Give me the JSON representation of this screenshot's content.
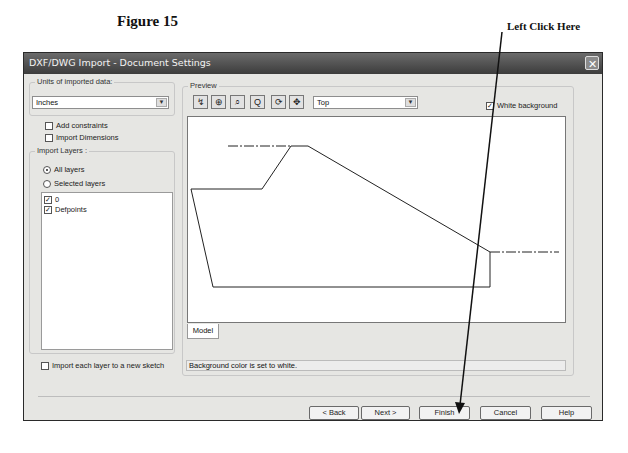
{
  "figure": {
    "title": "Figure 15",
    "callout": "Left Click Here"
  },
  "dialog": {
    "title": "DXF/DWG Import - Document Settings",
    "close_icon": "close-x-icon",
    "units": {
      "legend": "Units of imported data:",
      "selected": "Inches"
    },
    "options": {
      "add_constraints": {
        "label": "Add constraints",
        "checked": false
      },
      "import_dimensions": {
        "label": "Import Dimensions",
        "checked": false
      }
    },
    "import_layers": {
      "legend": "Import Layers :",
      "radios": [
        {
          "label": "All layers",
          "selected": true
        },
        {
          "label": "Selected layers",
          "selected": false
        }
      ],
      "layers": [
        {
          "label": "0",
          "checked": true
        },
        {
          "label": "Defpoints",
          "checked": true
        }
      ]
    },
    "import_each_layer": {
      "label": "Import each layer to a new sketch",
      "checked": false
    },
    "preview": {
      "legend": "Preview",
      "tools": [
        "select-icon",
        "zoom-icon",
        "zoom-window-icon",
        "zoom-fit-icon",
        "rotate-icon",
        "pan-icon"
      ],
      "view_selected": "Top",
      "white_background": {
        "label": "White background",
        "checked": true
      },
      "tab": "Model",
      "status": "Background color is set to white."
    },
    "buttons": {
      "back": "< Back",
      "next": "Next >",
      "finish": "Finish",
      "cancel": "Cancel",
      "help": "Help"
    }
  }
}
